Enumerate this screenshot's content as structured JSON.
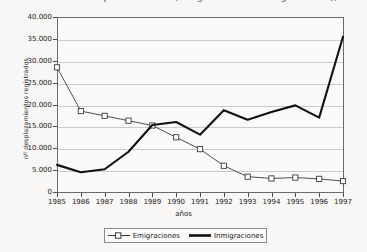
{
  "chart": {
    "title": "Evolución de los desplazamientos (emigraciones e inmigraciones), 1985-1997",
    "xlabel": "años",
    "ylabel": "nº desplazamientos registrados"
  },
  "legend": {
    "position": "bottom-center",
    "entries": [
      {
        "label": "Emigraciones",
        "marker": "open-square-line",
        "color": "#3b3b3b"
      },
      {
        "label": "Inmigraciones",
        "marker": "thick-line",
        "color": "#111111"
      }
    ]
  },
  "axis": {
    "yticks": [
      "40.000",
      "35.000",
      "30.000",
      "25.000",
      "20.000",
      "15.000",
      "10.000",
      "5.000",
      "0"
    ],
    "xticks": [
      "1985",
      "1986",
      "1987",
      "1988",
      "1989",
      "1990",
      "1991",
      "1992",
      "1993",
      "1994",
      "1995",
      "1996",
      "1997"
    ]
  },
  "chart_data": {
    "type": "line",
    "title": "Evolución de los desplazamientos (emigraciones e inmigraciones), 1985-1997",
    "xlabel": "años",
    "ylabel": "nº desplazamientos registrados",
    "x": [
      1985,
      1986,
      1987,
      1988,
      1989,
      1990,
      1991,
      1992,
      1993,
      1994,
      1995,
      1996,
      1997
    ],
    "categories": [
      "1985",
      "1986",
      "1987",
      "1988",
      "1989",
      "1990",
      "1991",
      "1992",
      "1993",
      "1994",
      "1995",
      "1996",
      "1997"
    ],
    "series": [
      {
        "name": "Emigraciones",
        "marker": "open-square",
        "color": "#3b3b3b",
        "values": [
          28500,
          18500,
          17400,
          16300,
          15200,
          12500,
          9800,
          6000,
          3500,
          3100,
          3300,
          3000,
          2500
        ]
      },
      {
        "name": "Inmigraciones",
        "marker": "none",
        "color": "#111111",
        "values": [
          6200,
          4500,
          5200,
          9200,
          15300,
          16000,
          13100,
          18700,
          16500,
          18300,
          19800,
          17000,
          35500
        ]
      }
    ],
    "ylim": [
      0,
      40000
    ],
    "ytick_step": 5000,
    "grid": true,
    "legend_position": "bottom-center"
  }
}
